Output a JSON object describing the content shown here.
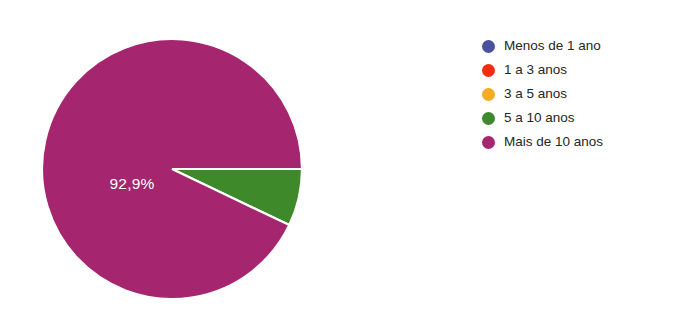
{
  "chart_data": {
    "type": "pie",
    "title": "",
    "subtitle": "",
    "xlabel": "",
    "ylabel": "",
    "legend_position": "right",
    "grid": false,
    "categories": [
      "Menos de 1 ano",
      "1 a 3 anos",
      "3 a 5 anos",
      "5 a 10 anos",
      "Mais de 10 anos"
    ],
    "values": [
      0,
      0,
      0,
      7.1,
      92.9
    ],
    "value_unit": "%",
    "colors": [
      "#4a52a0",
      "#f42d10",
      "#f5ab22",
      "#3e8a2b",
      "#a5256f"
    ],
    "slices": [
      {
        "label": "Menos de 1 ano",
        "value": 0,
        "color": "#4a52a0",
        "data_label": "",
        "start_angle": 0,
        "sweep_angle": 0
      },
      {
        "label": "1 a 3 anos",
        "value": 0,
        "color": "#f42d10",
        "data_label": "",
        "start_angle": 0,
        "sweep_angle": 0
      },
      {
        "label": "3 a 5 anos",
        "value": 0,
        "color": "#f5ab22",
        "data_label": "",
        "start_angle": 0,
        "sweep_angle": 0
      },
      {
        "label": "5 a 10 anos",
        "value": 7.1,
        "color": "#3e8a2b",
        "data_label": "",
        "start_angle": 0,
        "sweep_angle": 25.56
      },
      {
        "label": "Mais de 10 anos",
        "value": 92.9,
        "color": "#a5256f",
        "data_label": "92,9%",
        "start_angle": 25.56,
        "sweep_angle": 334.44
      }
    ],
    "annotations": [
      {
        "text": "92,9%",
        "x": 90,
        "y": 150,
        "color": "#ffffff"
      }
    ]
  },
  "pie": {
    "center_x": 130,
    "center_y": 134,
    "radius": 130,
    "label_text": "92,9%"
  },
  "legend": {
    "items": [
      {
        "label": "Menos de 1 ano",
        "color": "#4a52a0"
      },
      {
        "label": "1 a 3 anos",
        "color": "#f42d10"
      },
      {
        "label": "3 a 5 anos",
        "color": "#f5ab22"
      },
      {
        "label": "5 a 10 anos",
        "color": "#3e8a2b"
      },
      {
        "label": "Mais de 10 anos",
        "color": "#a5256f"
      }
    ]
  },
  "theme": {
    "background": "#ffffff",
    "text_color": "#262626",
    "slice_border": "#ffffff"
  }
}
